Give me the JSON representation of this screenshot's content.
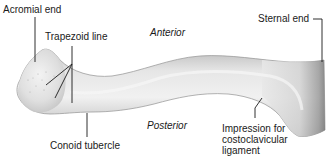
{
  "figure": {
    "labels": {
      "acromial_end": "Acromial end",
      "trapezoid_line": "Trapezoid line",
      "anterior": "Anterior",
      "sternal_end": "Sternal end",
      "posterior": "Posterior",
      "conoid_tubercle": "Conoid tubercle",
      "impression_line1": "Impression for",
      "impression_line2": "costoclavicular",
      "impression_line3": "ligament"
    },
    "colors": {
      "background": "#ffffff",
      "bone_light": "#e9e9e9",
      "bone_mid": "#cfcfcf",
      "bone_dark": "#9a9a9a",
      "leader_line": "#1a1a1a",
      "text": "#1a1a1a"
    }
  }
}
